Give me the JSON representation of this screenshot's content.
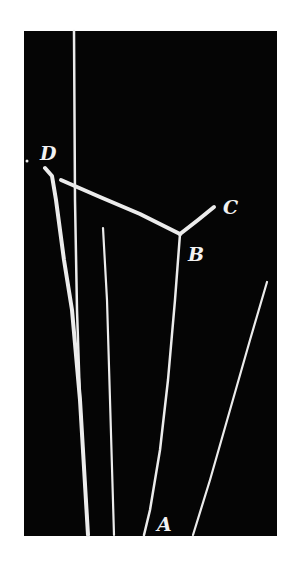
{
  "figure": {
    "background_color": "#ffffff",
    "plate_color": "#050505",
    "track_color": "#ececec",
    "plate": {
      "x": 24,
      "y": 31,
      "width": 253,
      "height": 505
    },
    "labels": [
      {
        "id": "D",
        "text": "D",
        "x": 40,
        "y": 160
      },
      {
        "id": "C",
        "text": "C",
        "x": 223,
        "y": 214
      },
      {
        "id": "B",
        "text": "B",
        "x": 188,
        "y": 261
      },
      {
        "id": "A",
        "text": "A",
        "x": 157,
        "y": 531
      }
    ],
    "tracks": [
      {
        "name": "vertical-beam-track",
        "points": "74,31 75,200 77,310 80,400 88,535",
        "width": 2.5
      },
      {
        "name": "track-D",
        "points": "45,168 52,176 56,200 64,260 72,310 80,400 88,535",
        "width": 4
      },
      {
        "name": "track-DB",
        "points": "61,180 100,197 140,214 180,234",
        "width": 4
      },
      {
        "name": "track-BC",
        "points": "180,234 198,220 214,207",
        "width": 4
      },
      {
        "name": "track-BA",
        "points": "180,234 175,300 168,380 160,450 150,510 144,535",
        "width": 2.5
      },
      {
        "name": "thin-track-center",
        "points": "103,228 107,300 110,400 114,535",
        "width": 2.2
      },
      {
        "name": "track-right",
        "points": "267,282 250,340 230,410 210,480 193,535",
        "width": 2.2
      }
    ],
    "dot": {
      "x": 27,
      "y": 161,
      "r": 1.5
    }
  }
}
